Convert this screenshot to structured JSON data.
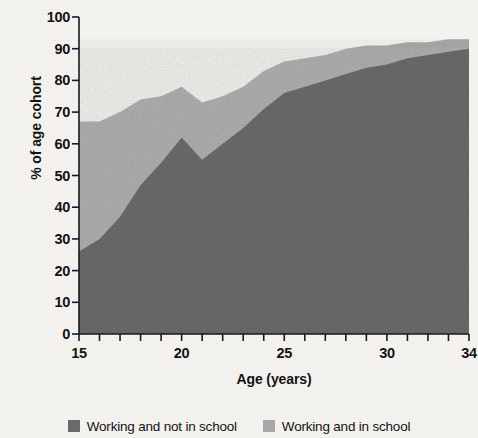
{
  "chart_data": {
    "type": "area",
    "stacked": true,
    "title": "",
    "xlabel": "Age (years)",
    "ylabel": "% of age cohort",
    "xlim": [
      15,
      34
    ],
    "ylim": [
      0,
      100
    ],
    "grid": false,
    "legend_position": "bottom",
    "x": [
      15,
      16,
      17,
      18,
      19,
      20,
      21,
      22,
      23,
      24,
      25,
      26,
      27,
      28,
      29,
      30,
      31,
      32,
      33,
      34
    ],
    "xticks": [
      15,
      16,
      17,
      18,
      19,
      20,
      21,
      22,
      23,
      24,
      25,
      26,
      27,
      28,
      29,
      30,
      31,
      32,
      33,
      34
    ],
    "xtick_labels": [
      "15",
      "",
      "",
      "",
      "",
      "20",
      "",
      "",
      "",
      "",
      "25",
      "",
      "",
      "",
      "",
      "30",
      "",
      "",
      "",
      "34"
    ],
    "yticks": [
      0,
      10,
      20,
      30,
      40,
      50,
      60,
      70,
      80,
      90,
      100
    ],
    "ytick_labels": [
      "0",
      "10",
      "20",
      "30",
      "40",
      "50",
      "60",
      "70",
      "80",
      "90",
      "100"
    ],
    "series": [
      {
        "name": "Working and not in school",
        "color": "#6a6a6a",
        "values": [
          26,
          30,
          37,
          47,
          54,
          62,
          55,
          60,
          65,
          71,
          76,
          78,
          80,
          82,
          84,
          85,
          87,
          88,
          89,
          90
        ]
      },
      {
        "name": "Working and in school",
        "color": "#a8a8a8",
        "values": [
          41,
          37,
          33,
          27,
          21,
          16,
          18,
          15,
          13,
          12,
          10,
          9,
          8,
          8,
          7,
          6,
          5,
          4,
          4,
          3
        ]
      }
    ],
    "totals": [
      67,
      67,
      70,
      74,
      75,
      78,
      73,
      75,
      78,
      83,
      86,
      87,
      88,
      90,
      91,
      91,
      92,
      92,
      93,
      93
    ]
  },
  "legend": {
    "entries": [
      {
        "label": "Working and not in school",
        "swatch_color": "#6a6a6a",
        "swatch_icon": "legend-swatch-icon"
      },
      {
        "label": "Working and in school",
        "swatch_color": "#a8a8a8",
        "swatch_icon": "legend-swatch-icon"
      }
    ]
  },
  "axes": {
    "x_title": "Age (years)",
    "y_title": "% of age cohort"
  },
  "colors": {
    "background": "#f4f2ee",
    "axis": "#1a1a1a",
    "text": "#131313",
    "series_dark": "#6a6a6a",
    "series_light": "#a8a8a8"
  }
}
